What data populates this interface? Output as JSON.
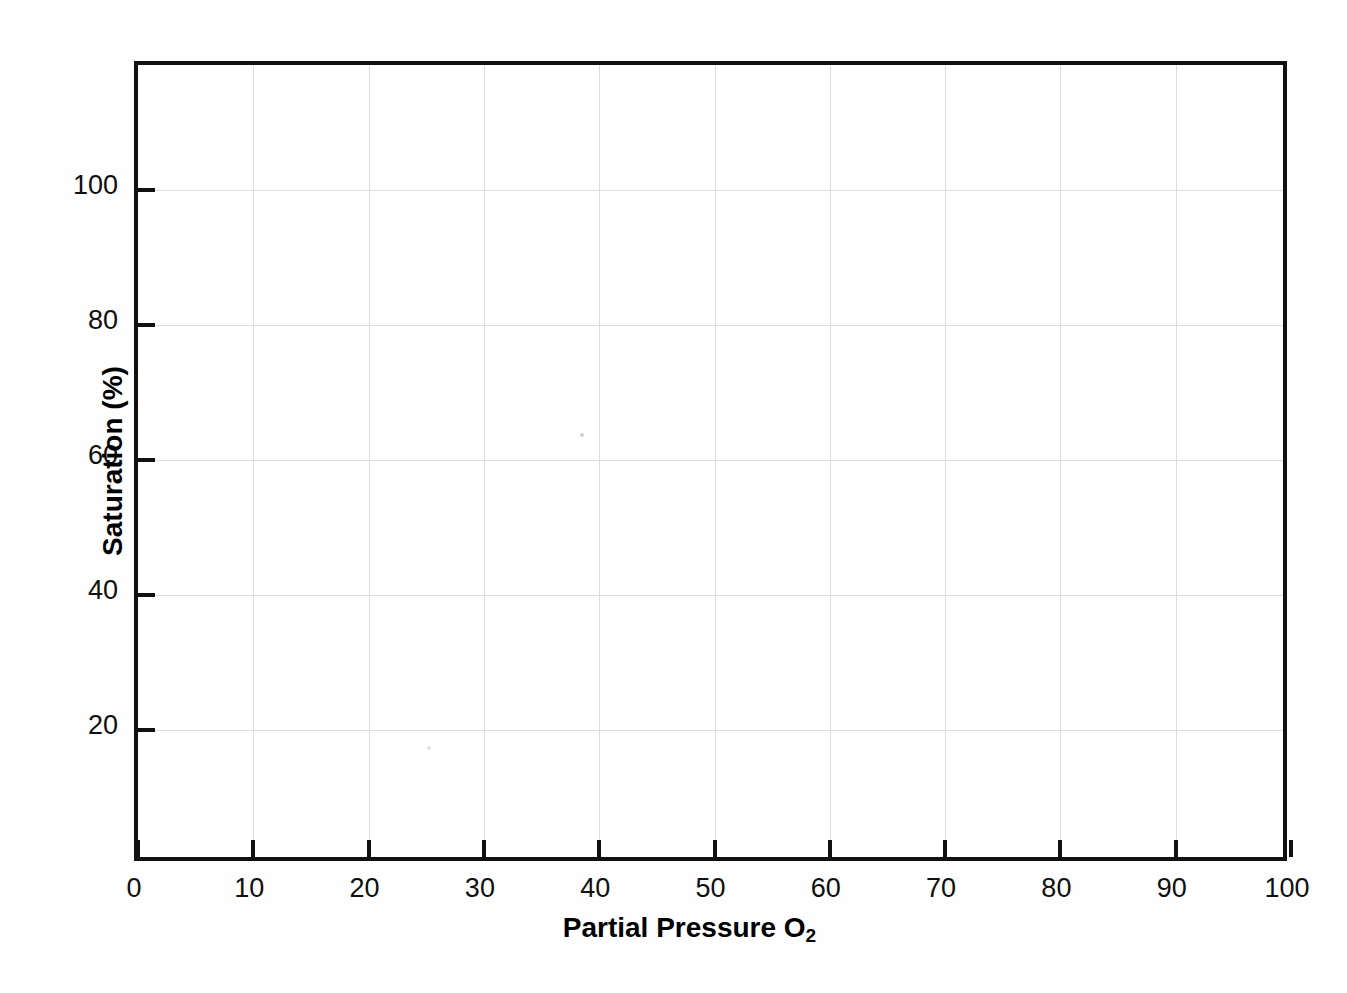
{
  "chart_data": {
    "type": "line",
    "title": "",
    "subtitle": "",
    "xlabel_text": "Partial Pressure O",
    "xlabel_sub": "2",
    "xlabel": "Partial Pressure O2",
    "ylabel": "Saturation (%)",
    "x_ticks": [
      0,
      10,
      20,
      30,
      40,
      50,
      60,
      70,
      80,
      90,
      100
    ],
    "x_tick_labels": [
      "0",
      "10",
      "20",
      "30",
      "40",
      "50",
      "60",
      "70",
      "80",
      "90",
      "100"
    ],
    "y_ticks": [
      20,
      40,
      60,
      80,
      100
    ],
    "y_tick_labels": [
      "20",
      "40",
      "60",
      "80",
      "100"
    ],
    "xlim": [
      0,
      100
    ],
    "ylim": [
      0,
      118.5
    ],
    "grid": true,
    "grid_color": "#dddddd",
    "axis_color": "#111111",
    "background": "#ffffff",
    "legend": null,
    "legend_position": "none",
    "series": [],
    "annotations": [],
    "note": "blank plotting grid template; no data series plotted"
  },
  "page": {
    "background": "#fefefe"
  }
}
